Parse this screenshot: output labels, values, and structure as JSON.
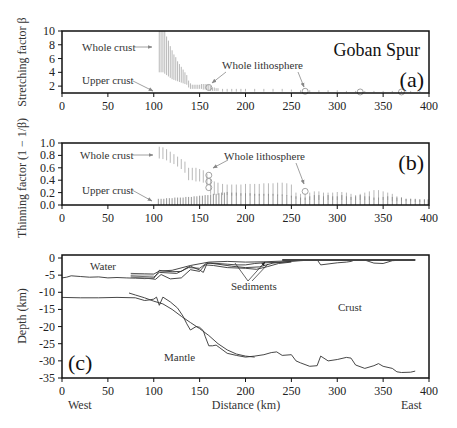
{
  "figure": {
    "title": "Goban Spur",
    "panel_a_label": "(a)",
    "panel_b_label": "(b)",
    "panel_c_label": "(c)",
    "colors": {
      "frame": "#111111",
      "bars_whole_crust": "#b8b8b8",
      "bars_upper_crust": "#8a8a8a",
      "profile": "#333333",
      "arrow": "#888888"
    }
  },
  "chart_data": [
    {
      "type": "bar",
      "panel": "a",
      "title": "Goban Spur",
      "ylabel": "Stretching factor β",
      "xlabel": "",
      "xlim": [
        0,
        400
      ],
      "ylim": [
        1,
        10
      ],
      "xticks": [
        0,
        50,
        100,
        150,
        200,
        250,
        300,
        350,
        400
      ],
      "yticks": [
        2,
        4,
        6,
        8,
        10
      ],
      "annotations": [
        "Whole crust",
        "Upper crust",
        "Whole lithosphere"
      ],
      "series": [
        {
          "name": "Whole crust",
          "style": "range-bars",
          "x": [
            106,
            108,
            110,
            112,
            114,
            116,
            118,
            120,
            122,
            124,
            126,
            128,
            130,
            132,
            134,
            136,
            138,
            140,
            142,
            144,
            146,
            148,
            150,
            152,
            154,
            156,
            158,
            160,
            162,
            164,
            166,
            168,
            170,
            175,
            180,
            185,
            190,
            195,
            200,
            210,
            220,
            230,
            240,
            250,
            260,
            270,
            280,
            290,
            300,
            310,
            320,
            330,
            340,
            350,
            360,
            370,
            380,
            390
          ],
          "low": [
            4.0,
            4.0,
            4.0,
            3.8,
            3.6,
            3.4,
            3.2,
            3.0,
            2.9,
            2.8,
            2.7,
            2.6,
            2.5,
            2.4,
            2.3,
            2.2,
            1.8,
            1.6,
            1.6,
            1.6,
            1.6,
            1.6,
            1.6,
            1.6,
            1.5,
            1.5,
            1.5,
            1.4,
            1.3,
            1.3,
            1.3,
            1.3,
            1.3,
            1.2,
            1.2,
            1.2,
            1.2,
            1.2,
            1.2,
            1.2,
            1.2,
            1.2,
            1.2,
            1.2,
            1.1,
            1.1,
            1.1,
            1.1,
            1.1,
            1.1,
            1.1,
            1.1,
            1.1,
            1.1,
            1.1,
            1.1,
            1.1,
            1.1
          ],
          "high": [
            10,
            10,
            10,
            10,
            9.2,
            8.6,
            7.8,
            7.2,
            6.6,
            6.2,
            5.6,
            5.2,
            4.8,
            4.4,
            4.0,
            3.6,
            2.8,
            2.4,
            2.2,
            2.2,
            2.2,
            2.2,
            2.2,
            2.3,
            2.3,
            2.3,
            2.3,
            2.2,
            2.0,
            1.8,
            1.8,
            1.7,
            1.7,
            1.6,
            1.6,
            1.6,
            1.6,
            1.6,
            1.6,
            1.6,
            1.6,
            1.6,
            1.6,
            1.5,
            1.4,
            1.4,
            1.4,
            1.4,
            1.4,
            1.3,
            1.3,
            1.3,
            1.3,
            1.3,
            1.3,
            1.3,
            1.3,
            1.3
          ]
        },
        {
          "name": "Whole lithosphere",
          "style": "circles",
          "x": [
            160,
            265,
            325,
            370
          ],
          "values": [
            1.8,
            1.25,
            1.15,
            1.15
          ]
        }
      ]
    },
    {
      "type": "bar",
      "panel": "b",
      "ylabel": "Thinning factor (1 − 1/β)",
      "xlabel": "",
      "xlim": [
        0,
        400
      ],
      "ylim": [
        0,
        1.0
      ],
      "xticks": [
        0,
        50,
        100,
        150,
        200,
        250,
        300,
        350,
        400
      ],
      "yticks": [
        0.0,
        0.2,
        0.4,
        0.6,
        0.8,
        1.0
      ],
      "annotations": [
        "Whole crust",
        "Upper crust",
        "Whole lithosphere"
      ],
      "series": [
        {
          "name": "Whole crust",
          "style": "range-bars",
          "x": [
            106,
            110,
            114,
            118,
            122,
            126,
            130,
            134,
            138,
            142,
            146,
            150,
            154,
            158,
            162,
            166,
            170,
            175,
            180,
            185,
            190,
            195,
            200,
            205,
            210,
            215,
            220,
            225,
            230,
            235,
            240,
            245,
            250,
            255,
            260,
            265,
            270,
            275,
            280,
            285,
            290,
            295,
            300,
            305,
            310,
            315,
            320,
            325,
            330,
            335,
            340,
            345,
            350,
            355,
            360,
            365,
            370,
            375,
            380,
            385,
            390,
            395
          ],
          "low": [
            0.75,
            0.74,
            0.72,
            0.68,
            0.66,
            0.62,
            0.58,
            0.52,
            0.4,
            0.4,
            0.38,
            0.38,
            0.36,
            0.32,
            0.18,
            0.16,
            0.16,
            0.16,
            0.16,
            0.15,
            0.15,
            0.15,
            0.15,
            0.15,
            0.15,
            0.15,
            0.15,
            0.15,
            0.15,
            0.15,
            0.15,
            0.15,
            0.12,
            0.1,
            0.08,
            0.08,
            0.08,
            0.08,
            0.08,
            0.08,
            0.08,
            0.08,
            0.08,
            0.08,
            0.08,
            0.08,
            0.08,
            0.08,
            0.08,
            0.08,
            0.08,
            0.08,
            0.08,
            0.08,
            0.06,
            0.06,
            0.06,
            0.06,
            0.06,
            0.05,
            0.05,
            0.05
          ],
          "high": [
            0.94,
            0.93,
            0.9,
            0.86,
            0.82,
            0.78,
            0.74,
            0.7,
            0.6,
            0.6,
            0.6,
            0.58,
            0.56,
            0.5,
            0.42,
            0.38,
            0.36,
            0.34,
            0.33,
            0.33,
            0.33,
            0.33,
            0.34,
            0.34,
            0.34,
            0.34,
            0.35,
            0.35,
            0.35,
            0.36,
            0.36,
            0.35,
            0.33,
            0.2,
            0.18,
            0.18,
            0.2,
            0.22,
            0.22,
            0.2,
            0.2,
            0.2,
            0.21,
            0.21,
            0.2,
            0.18,
            0.16,
            0.18,
            0.2,
            0.22,
            0.24,
            0.24,
            0.22,
            0.2,
            0.18,
            0.14,
            0.12,
            0.1,
            0.1,
            0.09,
            0.09,
            0.09
          ]
        },
        {
          "name": "Upper crust",
          "style": "range-bars",
          "x": [
            105,
            108,
            111,
            114,
            117,
            120,
            123,
            126,
            129,
            132,
            135,
            138,
            141,
            144,
            147,
            150,
            153,
            156,
            159,
            162,
            165,
            168,
            171,
            174,
            177,
            180,
            185,
            190,
            195,
            200,
            205,
            210,
            215,
            220,
            225,
            230,
            235,
            240,
            245,
            250,
            255,
            260,
            265,
            270,
            275,
            280,
            285,
            290,
            295,
            300,
            305,
            310,
            315,
            320,
            325,
            330,
            335,
            340,
            345,
            350,
            355,
            360,
            365,
            370,
            375,
            380,
            385,
            390,
            395,
            399
          ],
          "low": [
            0,
            0,
            0,
            0,
            0,
            0,
            0,
            0,
            0,
            0,
            0,
            0,
            0,
            0,
            0,
            0,
            0,
            0,
            0,
            0,
            0,
            0,
            0,
            0,
            0,
            0,
            0,
            0,
            0,
            0,
            0,
            0,
            0,
            0,
            0,
            0,
            0,
            0,
            0,
            0,
            0,
            0,
            0,
            0,
            0,
            0,
            0,
            0,
            0,
            0,
            0,
            0,
            0,
            0,
            0,
            0,
            0,
            0,
            0,
            0,
            0,
            0,
            0,
            0,
            0,
            0,
            0,
            0,
            0,
            0
          ],
          "high": [
            0.1,
            0.1,
            0.1,
            0.11,
            0.11,
            0.11,
            0.12,
            0.12,
            0.12,
            0.12,
            0.13,
            0.13,
            0.13,
            0.14,
            0.14,
            0.15,
            0.15,
            0.16,
            0.16,
            0.17,
            0.18,
            0.18,
            0.19,
            0.2,
            0.2,
            0.21,
            0.2,
            0.2,
            0.19,
            0.19,
            0.19,
            0.18,
            0.18,
            0.18,
            0.18,
            0.18,
            0.17,
            0.17,
            0.16,
            0.15,
            0.14,
            0.12,
            0.12,
            0.14,
            0.16,
            0.16,
            0.14,
            0.16,
            0.14,
            0.14,
            0.16,
            0.14,
            0.13,
            0.14,
            0.16,
            0.14,
            0.14,
            0.12,
            0.12,
            0.13,
            0.14,
            0.13,
            0.12,
            0.12,
            0.1,
            0.1,
            0.1,
            0.09,
            0.09,
            0.09
          ]
        },
        {
          "name": "Whole lithosphere",
          "style": "circles",
          "x": [
            160,
            160,
            160,
            265
          ],
          "values": [
            0.48,
            0.38,
            0.28,
            0.22
          ]
        }
      ]
    },
    {
      "type": "line",
      "panel": "c",
      "ylabel": "Depth (km)",
      "xlabel": "Distance (km)",
      "xlabel_left": "West",
      "xlabel_right": "East",
      "xlim": [
        0,
        400
      ],
      "ylim": [
        -35,
        0
      ],
      "xticks": [
        0,
        50,
        100,
        150,
        200,
        250,
        300,
        350,
        400
      ],
      "yticks": [
        0,
        -5,
        -10,
        -15,
        -20,
        -25,
        -30,
        -35
      ],
      "annotations": [
        "Water",
        "Sediments",
        "Crust",
        "Mantle"
      ],
      "series": [
        {
          "name": "Seafloor",
          "x": [
            0,
            5,
            10,
            20,
            30,
            40,
            50,
            60,
            70,
            80,
            90,
            100,
            104,
            106,
            110,
            120,
            130,
            135,
            140,
            150,
            154,
            158,
            162,
            170,
            180,
            190,
            200,
            210,
            220,
            230,
            240,
            250,
            260,
            270,
            278,
            282,
            300,
            310,
            315,
            320,
            330,
            340,
            350,
            360,
            370,
            385
          ],
          "y": [
            -5.8,
            -5.6,
            -5.2,
            -5.4,
            -5.6,
            -5.5,
            -5.8,
            -5.7,
            -5.8,
            -5.9,
            -6.0,
            -5.9,
            -4.5,
            -3.6,
            -3.8,
            -4.0,
            -3.9,
            -3.0,
            -2.4,
            -3.5,
            -4.2,
            -1.6,
            -1.5,
            -1.6,
            -1.8,
            -2.0,
            -2.0,
            -1.6,
            -1.4,
            -1.3,
            -1.2,
            -1.0,
            -0.8,
            -0.6,
            -0.5,
            -2.0,
            -1.4,
            -1.2,
            -1.0,
            -0.5,
            -0.6,
            -1.5,
            -1.6,
            -0.8,
            -0.6,
            -0.6
          ]
        },
        {
          "name": "Sediment top",
          "x": [
            75,
            90,
            100,
            106,
            120,
            140,
            160,
            180,
            200,
            220,
            240,
            260,
            280,
            300,
            320,
            340,
            360,
            385
          ],
          "y": [
            -4.5,
            -4.6,
            -4.7,
            -3.8,
            -3.6,
            -2.2,
            -1.2,
            -1.0,
            -1.2,
            -1.1,
            -0.9,
            -0.7,
            -0.5,
            -0.5,
            -0.5,
            -0.5,
            -0.5,
            -0.5
          ]
        },
        {
          "name": "Sediment layer 1",
          "x": [
            75,
            95,
            100,
            106,
            125,
            138,
            150,
            158,
            170,
            185,
            200,
            215,
            230,
            250
          ],
          "y": [
            -5.2,
            -5.5,
            -5.6,
            -4.2,
            -4.5,
            -2.8,
            -3.0,
            -1.4,
            -1.8,
            -2.4,
            -2.8,
            -2.6,
            -1.5,
            -1.0
          ]
        },
        {
          "name": "Sediment layer 2",
          "x": [
            75,
            92,
            102,
            108,
            118,
            130,
            140,
            150,
            156,
            165,
            180,
            200,
            212,
            224,
            236,
            250
          ],
          "y": [
            -5.6,
            -5.9,
            -6.2,
            -4.8,
            -6.1,
            -5.8,
            -3.4,
            -3.9,
            -2.0,
            -2.2,
            -2.8,
            -3.0,
            -3.3,
            -2.5,
            -1.6,
            -1.2
          ]
        },
        {
          "name": "Moho (observed)",
          "x": [
            0,
            20,
            40,
            60,
            80,
            90,
            96,
            100,
            103,
            106,
            110,
            118,
            126,
            132,
            136,
            140,
            146,
            150,
            154,
            156,
            160,
            164,
            168,
            172,
            180,
            190,
            200,
            210,
            220,
            228,
            234,
            240,
            250,
            255,
            260,
            270,
            278,
            282,
            290,
            300,
            310,
            315,
            320,
            330,
            340,
            345,
            350,
            360,
            365,
            370,
            380,
            385
          ],
          "y": [
            -11.5,
            -11.6,
            -11.6,
            -11.5,
            -11.6,
            -12.4,
            -12.2,
            -12.0,
            -11.4,
            -13.8,
            -11.4,
            -12.8,
            -14.6,
            -17.0,
            -19.2,
            -21.0,
            -20.0,
            -20.2,
            -21.2,
            -22.8,
            -25.6,
            -25.6,
            -25.4,
            -26.2,
            -27.8,
            -28.4,
            -28.9,
            -28.6,
            -28.2,
            -27.6,
            -27.4,
            -28.4,
            -28.2,
            -30.0,
            -30.6,
            -31.6,
            -31.4,
            -28.6,
            -30.0,
            -29.6,
            -29.0,
            -29.2,
            -31.2,
            -32.2,
            -31.4,
            -30.8,
            -31.6,
            -32.2,
            -33.2,
            -33.4,
            -33.3,
            -33.0
          ]
        },
        {
          "name": "Moho (model)",
          "x": [
            73,
            80,
            90,
            100,
            110,
            120,
            130,
            140,
            150,
            160,
            170,
            180,
            190,
            200,
            210
          ],
          "y": [
            -10.2,
            -10.8,
            -11.6,
            -12.6,
            -13.4,
            -15.0,
            -17.0,
            -18.8,
            -20.6,
            -22.6,
            -25.0,
            -26.8,
            -28.0,
            -28.6,
            -28.9
          ]
        }
      ]
    }
  ],
  "text": {
    "ylabel_a": "Stretching factor β",
    "ylabel_b": "Thinning factor (1 − 1/β)",
    "ylabel_c": "Depth (km)",
    "xlabel_c": "Distance (km)",
    "west": "West",
    "east": "East",
    "whole_crust": "Whole crust",
    "upper_crust": "Upper crust",
    "whole_lithosphere": "Whole lithosphere",
    "water": "Water",
    "sediments": "Sediments",
    "crust": "Crust",
    "mantle": "Mantle"
  }
}
